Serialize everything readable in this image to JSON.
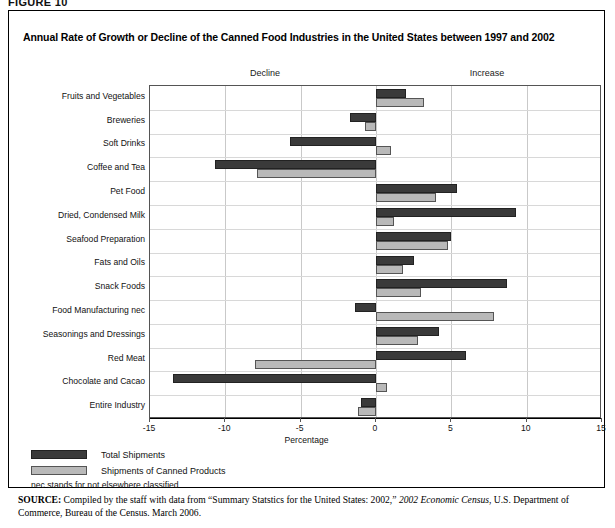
{
  "figure_label": "FIGURE 10",
  "title": "Annual Rate of Growth or Decline of the Canned Food Industries in the United States between 1997 and 2002",
  "direction_labels": {
    "decline": "Decline",
    "increase": "Increase"
  },
  "legend": [
    {
      "key": "total",
      "label": "Total Shipments",
      "color": "#3a3a3a"
    },
    {
      "key": "canned",
      "label": "Shipments of Canned Products",
      "color": "#b9b9b9"
    }
  ],
  "note": "nec stands for not elsewhere classified",
  "source": {
    "prefix": "SOURCE:",
    "text_1": " Compiled by the staff with data from “Summary Statstics for the United States: 2002,” ",
    "italic": "2002 Economic Census",
    "text_2": ", U.S. Department of Commerce, Bureau of the Census. March 2006."
  },
  "chart_data": {
    "type": "bar",
    "orientation": "horizontal",
    "title": "Annual Rate of Growth or Decline of the Canned Food Industries in the United States between 1997 and 2002",
    "xlabel": "Percentage",
    "ylabel": "",
    "xlim": [
      -15,
      15
    ],
    "xticks": [
      -15,
      -10,
      -5,
      0,
      5,
      10,
      15
    ],
    "xtick_labels": [
      "-15",
      "-10",
      "-5",
      "0",
      "5",
      "10",
      "15"
    ],
    "grid": true,
    "legend_position": "below-left",
    "categories": [
      "Fruits and Vegetables",
      "Breweries",
      "Soft Drinks",
      "Coffee and Tea",
      "Pet Food",
      "Dried, Condensed Milk",
      "Seafood Preparation",
      "Fats and Oils",
      "Snack Foods",
      "Food Manufacturing nec",
      "Seasonings and Dressings",
      "Red Meat",
      "Chocolate and Cacao",
      "Entire Industry"
    ],
    "series": [
      {
        "name": "Total Shipments",
        "color": "#3a3a3a",
        "values": [
          2.0,
          -1.7,
          -5.7,
          -10.7,
          5.4,
          9.3,
          5.0,
          2.5,
          8.7,
          -1.4,
          4.2,
          6.0,
          -13.5,
          -1.0
        ]
      },
      {
        "name": "Shipments of Canned Products",
        "color": "#b9b9b9",
        "values": [
          3.2,
          -0.7,
          1.0,
          -7.9,
          4.0,
          1.2,
          4.8,
          1.8,
          3.0,
          7.8,
          2.8,
          -8.0,
          0.7,
          -1.2
        ]
      }
    ]
  }
}
